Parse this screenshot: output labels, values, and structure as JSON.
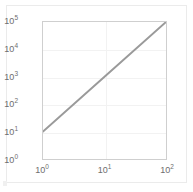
{
  "chart_data": {
    "type": "line",
    "title": "",
    "xlabel": "",
    "ylabel": "",
    "xscale": "log",
    "yscale": "log",
    "xlim": [
      1,
      100
    ],
    "ylim": [
      1,
      100000
    ],
    "grid": true,
    "legend": "none",
    "xticks": [
      {
        "value": 1,
        "mantissa": "10",
        "exponent": "0"
      },
      {
        "value": 10,
        "mantissa": "10",
        "exponent": "1"
      },
      {
        "value": 100,
        "mantissa": "10",
        "exponent": "2"
      }
    ],
    "yticks": [
      {
        "value": 1,
        "mantissa": "10",
        "exponent": "0"
      },
      {
        "value": 10,
        "mantissa": "10",
        "exponent": "1"
      },
      {
        "value": 100,
        "mantissa": "10",
        "exponent": "2"
      },
      {
        "value": 1000,
        "mantissa": "10",
        "exponent": "3"
      },
      {
        "value": 10000,
        "mantissa": "10",
        "exponent": "4"
      },
      {
        "value": 100000,
        "mantissa": "10",
        "exponent": "5"
      }
    ],
    "series": [
      {
        "name": "power-law",
        "color": "#9a9a9a",
        "linewidth": 2,
        "x": [
          1,
          10,
          100
        ],
        "y": [
          10,
          1000,
          100000
        ]
      }
    ],
    "colors": {
      "line": "#9a9a9a",
      "grid": "#f2f2f2",
      "axis": "#cfcfcf",
      "tick_text": "#6e6e6e",
      "figure_border": "#ebebeb",
      "background": "#ffffff"
    }
  }
}
